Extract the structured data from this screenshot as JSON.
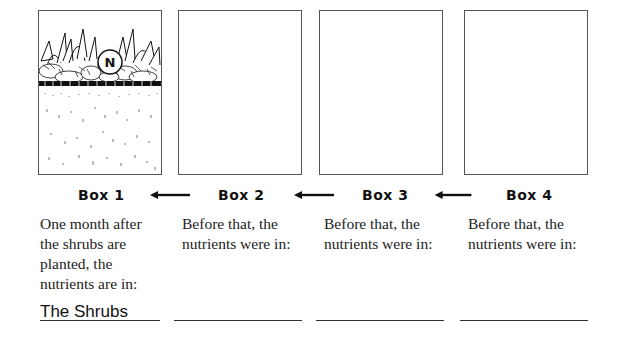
{
  "boxes": [
    {
      "label": "Box 1",
      "caption": "One month after the shrubs are planted, the nutrients are in:",
      "answer": "The Shrubs",
      "illustration": "shrubs-with-nutrient-N-above-soil",
      "nutrient_symbol": "N"
    },
    {
      "label": "Box 2",
      "caption": "Before that, the nutrients were in:",
      "answer": ""
    },
    {
      "label": "Box 3",
      "caption": "Before that, the nutrients were in:",
      "answer": ""
    },
    {
      "label": "Box 4",
      "caption": "Before that, the nutrients were in:",
      "answer": ""
    }
  ],
  "arrows": [
    {
      "from": "Box 2",
      "to": "Box 1",
      "direction": "left"
    },
    {
      "from": "Box 3",
      "to": "Box 2",
      "direction": "left"
    },
    {
      "from": "Box 4",
      "to": "Box 3",
      "direction": "left"
    }
  ]
}
